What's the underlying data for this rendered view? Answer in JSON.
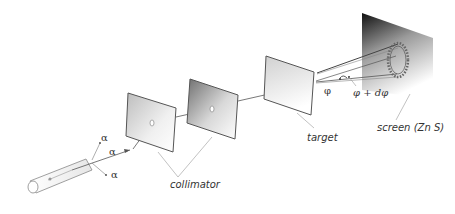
{
  "labels": {
    "alpha_1": "α",
    "alpha_2": "α",
    "alpha_3": "α",
    "collimator": "collimator",
    "target": "target",
    "screen": "screen (Zn S)",
    "phi": "φ",
    "phi_dphi": "φ + dφ"
  },
  "components": [
    {
      "name": "alpha-source",
      "desc": "cylindrical alpha particle source"
    },
    {
      "name": "collimator-plate-1",
      "desc": "first collimator plate with aperture"
    },
    {
      "name": "collimator-plate-2",
      "desc": "second collimator plate with aperture"
    },
    {
      "name": "target",
      "desc": "thin target foil"
    },
    {
      "name": "screen",
      "desc": "ZnS scintillation screen with scattering cone ring"
    }
  ],
  "colors": {
    "line": "#555555",
    "plate_light": "#f2f2f2",
    "plate_dark": "#8a8a8a",
    "screen_dark": "#1a1a1a",
    "text": "#333333"
  }
}
